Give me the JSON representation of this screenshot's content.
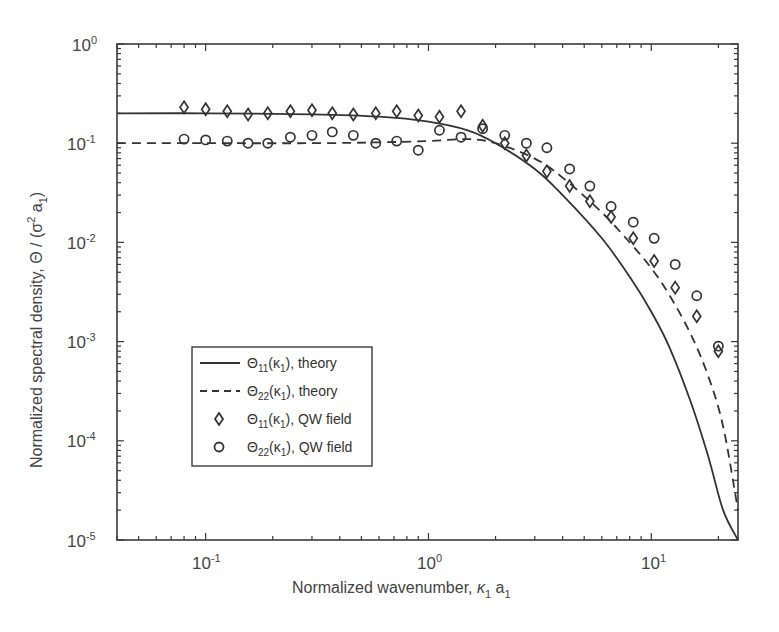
{
  "chart_data": {
    "type": "line",
    "title": "",
    "xlabel": "Normalized wavenumber, κ1 a1",
    "ylabel": "Normalized spectral density, Θ / (σ² a1)",
    "xscale": "log",
    "yscale": "log",
    "xlim": [
      0.04,
      24.5
    ],
    "ylim": [
      1e-05,
      1
    ],
    "grid": false,
    "legend_position": "lower-left (inside)",
    "x_tick_labels": [
      "10^-1",
      "10^0",
      "10^1"
    ],
    "y_tick_labels": [
      "10^0",
      "10^-1",
      "10^-2",
      "10^-3",
      "10^-4",
      "10^-5"
    ],
    "series": [
      {
        "name": "Θ11(κ1), theory",
        "style": "solid line",
        "x": [
          0.04,
          0.1,
          0.3,
          0.6,
          1.0,
          1.5,
          2.0,
          3.0,
          4.0,
          6.0,
          8.0,
          10.0,
          12.0,
          15.0,
          18.0,
          21.0,
          24.5
        ],
        "y": [
          0.2,
          0.2,
          0.195,
          0.185,
          0.165,
          0.135,
          0.1,
          0.055,
          0.03,
          0.011,
          0.0045,
          0.002,
          0.0009,
          0.00025,
          7e-05,
          2e-05,
          1e-05
        ]
      },
      {
        "name": "Θ22(κ1), theory",
        "style": "dashed line",
        "x": [
          0.04,
          0.1,
          0.3,
          0.6,
          1.0,
          1.5,
          2.0,
          3.0,
          4.0,
          6.0,
          8.0,
          10.0,
          12.0,
          15.0,
          18.0,
          21.0,
          24.5
        ],
        "y": [
          0.1,
          0.1,
          0.1,
          0.102,
          0.105,
          0.11,
          0.1,
          0.07,
          0.045,
          0.02,
          0.01,
          0.0055,
          0.003,
          0.0012,
          0.00045,
          0.00014,
          2e-05
        ]
      },
      {
        "name": "Θ11(κ1), QW field",
        "style": "diamond markers",
        "x": [
          0.08,
          0.1,
          0.125,
          0.155,
          0.19,
          0.24,
          0.3,
          0.37,
          0.46,
          0.58,
          0.72,
          0.9,
          1.12,
          1.4,
          1.75,
          2.2,
          2.75,
          3.4,
          4.3,
          5.3,
          6.6,
          8.3,
          10.3,
          12.8,
          16.0,
          20.0
        ],
        "y": [
          0.23,
          0.22,
          0.21,
          0.195,
          0.2,
          0.21,
          0.215,
          0.2,
          0.195,
          0.2,
          0.21,
          0.19,
          0.185,
          0.21,
          0.15,
          0.1,
          0.075,
          0.052,
          0.037,
          0.026,
          0.018,
          0.011,
          0.0065,
          0.0035,
          0.0018,
          0.0008
        ]
      },
      {
        "name": "Θ22(κ1), QW field",
        "style": "circle markers",
        "x": [
          0.08,
          0.1,
          0.125,
          0.155,
          0.19,
          0.24,
          0.3,
          0.37,
          0.46,
          0.58,
          0.72,
          0.9,
          1.12,
          1.4,
          1.75,
          2.2,
          2.75,
          3.4,
          4.3,
          5.3,
          6.6,
          8.3,
          10.3,
          12.8,
          16.0,
          20.0
        ],
        "y": [
          0.11,
          0.108,
          0.105,
          0.1,
          0.1,
          0.115,
          0.12,
          0.13,
          0.12,
          0.1,
          0.105,
          0.085,
          0.135,
          0.115,
          0.14,
          0.12,
          0.1,
          0.09,
          0.055,
          0.037,
          0.023,
          0.016,
          0.011,
          0.006,
          0.0029,
          0.0009
        ]
      }
    ]
  },
  "axes": {
    "xlabel_main": "Normalized wavenumber, ",
    "xlabel_kappa": "κ",
    "xlabel_sub1": "1",
    "xlabel_a": " a",
    "xlabel_sub2": "1",
    "ylabel_main": "Normalized spectral density,  Θ / (σ",
    "ylabel_sup": "2",
    "ylabel_a": " a",
    "ylabel_sub": "1",
    "ylabel_close": ")",
    "x_ticks": [
      {
        "base": "10",
        "exp": "-1"
      },
      {
        "base": "10",
        "exp": "0"
      },
      {
        "base": "10",
        "exp": "1"
      }
    ],
    "y_ticks": [
      {
        "base": "10",
        "exp": "0"
      },
      {
        "base": "10",
        "exp": "-1"
      },
      {
        "base": "10",
        "exp": "-2"
      },
      {
        "base": "10",
        "exp": "-3"
      },
      {
        "base": "10",
        "exp": "-4"
      },
      {
        "base": "10",
        "exp": "-5"
      }
    ]
  },
  "legend": {
    "items": [
      {
        "theta": "Θ",
        "sub": "11",
        "arg": "(κ",
        "argsub": "1",
        "rest": "), theory"
      },
      {
        "theta": "Θ",
        "sub": "22",
        "arg": "(κ",
        "argsub": "1",
        "rest": "), theory"
      },
      {
        "theta": "Θ",
        "sub": "11",
        "arg": "(κ",
        "argsub": "1",
        "rest": "), QW field"
      },
      {
        "theta": "Θ",
        "sub": "22",
        "arg": "(κ",
        "argsub": "1",
        "rest": "), QW field"
      }
    ]
  },
  "colors": {
    "axis": "#3a3a3a",
    "line": "#333333",
    "marker": "#333333",
    "text": "#444444",
    "background": "#ffffff"
  }
}
